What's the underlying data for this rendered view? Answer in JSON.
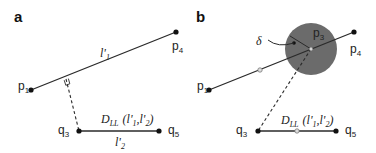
{
  "panels": [
    {
      "id": "a",
      "label": "a",
      "points": {
        "p1": {
          "label": "p",
          "sub": "1"
        },
        "p4": {
          "label": "p",
          "sub": "4"
        },
        "q3": {
          "label": "q",
          "sub": "3"
        },
        "q5": {
          "label": "q",
          "sub": "5"
        }
      },
      "line1_label": {
        "main": "l'",
        "sub": "1"
      },
      "line2_label": {
        "main": "l'",
        "sub": "2"
      },
      "distance_label": {
        "main": "D",
        "sub": "LL",
        "args": "(l'",
        "arg1_sub": "1",
        "comma": ",l'",
        "arg2_sub": "2",
        "close": ")"
      }
    },
    {
      "id": "b",
      "label": "b",
      "points": {
        "p1": {
          "label": "p",
          "sub": "1"
        },
        "p3": {
          "label": "p",
          "sub": "3"
        },
        "p4": {
          "label": "p",
          "sub": "4"
        },
        "q3": {
          "label": "q",
          "sub": "3"
        },
        "q5": {
          "label": "q",
          "sub": "5"
        }
      },
      "delta_label": "δ",
      "distance_label": {
        "main": "D",
        "sub": "LL",
        "args": "(l'",
        "arg1_sub": "1",
        "comma": ",l'",
        "arg2_sub": "2",
        "close": ")"
      }
    }
  ],
  "colors": {
    "line": "#2a2a2a",
    "circle_fill": "#6b6b6b",
    "hollow_marker": "#9a9a9a"
  }
}
